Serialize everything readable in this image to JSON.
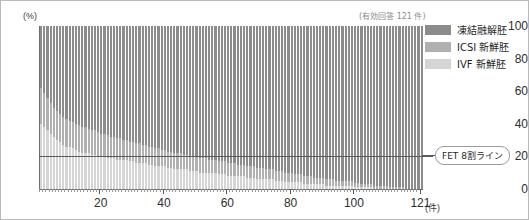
{
  "chart_data": {
    "type": "bar",
    "stacked": true,
    "stack_mode": "percent",
    "title": "",
    "subtitle": "",
    "annotation": "(有効回答 121 件)",
    "xlabel": "(件)",
    "ylabel": "(%)",
    "ylim": [
      0,
      100
    ],
    "yticks": [
      0,
      20,
      40,
      60,
      80,
      100
    ],
    "xlim": [
      1,
      121
    ],
    "xticks": [
      20,
      40,
      60,
      80,
      100,
      121
    ],
    "grid": false,
    "legend_position": "right-top",
    "reference_lines": [
      {
        "label": "FET 8割ライン",
        "axis": "y",
        "value": 20
      }
    ],
    "categories": [
      1,
      2,
      3,
      4,
      5,
      6,
      7,
      8,
      9,
      10,
      11,
      12,
      13,
      14,
      15,
      16,
      17,
      18,
      19,
      20,
      21,
      22,
      23,
      24,
      25,
      26,
      27,
      28,
      29,
      30,
      31,
      32,
      33,
      34,
      35,
      36,
      37,
      38,
      39,
      40,
      41,
      42,
      43,
      44,
      45,
      46,
      47,
      48,
      49,
      50,
      51,
      52,
      53,
      54,
      55,
      56,
      57,
      58,
      59,
      60,
      61,
      62,
      63,
      64,
      65,
      66,
      67,
      68,
      69,
      70,
      71,
      72,
      73,
      74,
      75,
      76,
      77,
      78,
      79,
      80,
      81,
      82,
      83,
      84,
      85,
      86,
      87,
      88,
      89,
      90,
      91,
      92,
      93,
      94,
      95,
      96,
      97,
      98,
      99,
      100,
      101,
      102,
      103,
      104,
      105,
      106,
      107,
      108,
      109,
      110,
      111,
      112,
      113,
      114,
      115,
      116,
      117,
      118,
      119,
      120,
      121
    ],
    "series": [
      {
        "name": "凍結融解胚",
        "color": "#8c8c8c",
        "values": [
          38,
          41,
          44,
          47,
          50,
          52,
          54,
          56,
          57,
          58,
          59,
          60,
          61,
          62,
          62,
          63,
          64,
          64,
          65,
          66,
          66,
          67,
          68,
          68,
          69,
          69,
          70,
          70,
          71,
          71,
          72,
          72,
          73,
          73,
          74,
          74,
          75,
          75,
          76,
          76,
          77,
          77,
          78,
          78,
          78,
          79,
          79,
          80,
          80,
          80,
          81,
          81,
          81,
          82,
          82,
          82,
          83,
          83,
          83,
          84,
          84,
          84,
          85,
          85,
          85,
          86,
          86,
          86,
          87,
          87,
          87,
          88,
          88,
          88,
          89,
          89,
          89,
          90,
          90,
          90,
          91,
          91,
          91,
          92,
          92,
          92,
          93,
          93,
          93,
          93,
          94,
          94,
          94,
          95,
          95,
          95,
          95,
          96,
          96,
          96,
          96,
          97,
          97,
          97,
          97,
          98,
          98,
          98,
          98,
          98,
          99,
          99,
          99,
          99,
          99,
          100,
          100,
          100,
          100,
          100,
          100
        ]
      },
      {
        "name": "ICSI 新鮮胚",
        "color": "#b0b0b0",
        "values": [
          22,
          21,
          20,
          19,
          18,
          18,
          17,
          17,
          17,
          16,
          16,
          16,
          16,
          16,
          16,
          15,
          15,
          15,
          15,
          14,
          14,
          14,
          13,
          13,
          13,
          13,
          12,
          12,
          12,
          12,
          12,
          12,
          11,
          11,
          11,
          11,
          11,
          11,
          10,
          10,
          10,
          10,
          10,
          10,
          10,
          9,
          9,
          9,
          9,
          9,
          9,
          9,
          9,
          8,
          8,
          8,
          8,
          8,
          8,
          8,
          8,
          8,
          7,
          7,
          7,
          7,
          7,
          7,
          7,
          7,
          7,
          6,
          6,
          6,
          6,
          6,
          6,
          6,
          6,
          6,
          5,
          5,
          5,
          5,
          5,
          5,
          4,
          4,
          4,
          4,
          4,
          4,
          4,
          3,
          3,
          3,
          3,
          3,
          3,
          3,
          3,
          2,
          2,
          2,
          2,
          2,
          2,
          2,
          2,
          2,
          1,
          1,
          1,
          1,
          1,
          0,
          0,
          0,
          0,
          0,
          0
        ]
      },
      {
        "name": "IVF 新鮮胚",
        "color": "#d5d5d5",
        "values": [
          40,
          38,
          36,
          34,
          32,
          30,
          29,
          27,
          26,
          26,
          25,
          24,
          23,
          22,
          22,
          22,
          21,
          21,
          20,
          20,
          20,
          19,
          19,
          19,
          18,
          18,
          18,
          18,
          17,
          17,
          16,
          16,
          16,
          16,
          15,
          15,
          14,
          14,
          14,
          14,
          13,
          13,
          12,
          12,
          12,
          12,
          12,
          11,
          11,
          11,
          10,
          10,
          10,
          10,
          10,
          10,
          9,
          9,
          9,
          8,
          8,
          8,
          8,
          8,
          8,
          7,
          7,
          7,
          6,
          6,
          6,
          6,
          6,
          6,
          5,
          5,
          5,
          4,
          4,
          4,
          4,
          4,
          4,
          3,
          3,
          3,
          3,
          3,
          3,
          3,
          2,
          2,
          2,
          2,
          2,
          2,
          2,
          2,
          2,
          1,
          1,
          1,
          1,
          1,
          1,
          0,
          0,
          0,
          0,
          0,
          0,
          0,
          0,
          0,
          0,
          0,
          0,
          0,
          0,
          0,
          0
        ]
      }
    ]
  },
  "legend": {
    "items": [
      {
        "label": "凍結融解胚",
        "color": "#8c8c8c"
      },
      {
        "label": "ICSI 新鮮胚",
        "color": "#b0b0b0"
      },
      {
        "label": "IVF 新鮮胚",
        "color": "#d5d5d5"
      }
    ]
  },
  "axes": {
    "y_unit": "(%)",
    "x_unit": "(件)",
    "y_ticks": [
      "0",
      "20",
      "40",
      "60",
      "80",
      "100"
    ],
    "x_ticks": [
      "20",
      "40",
      "60",
      "80",
      "100",
      "121"
    ]
  },
  "annotations": {
    "sample_note": "(有効回答 121 件)",
    "reference_label": "FET 8割ライン"
  }
}
